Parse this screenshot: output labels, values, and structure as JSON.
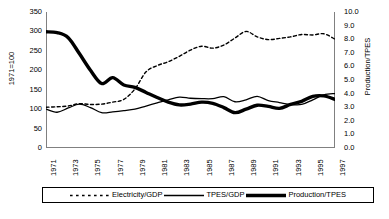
{
  "chart_data": {
    "type": "line",
    "title": "",
    "subtitle": "",
    "xlabel": "",
    "ylabel": "1971=100",
    "ylabel_right": "Production/TPES",
    "xlim": [
      1971,
      1997
    ],
    "ylim": [
      0,
      350
    ],
    "ylim_right": [
      0.0,
      10.0
    ],
    "grid": false,
    "legend_position": "bottom",
    "x": [
      1971,
      1972,
      1973,
      1974,
      1975,
      1976,
      1977,
      1978,
      1979,
      1980,
      1981,
      1982,
      1983,
      1984,
      1985,
      1986,
      1987,
      1988,
      1989,
      1990,
      1991,
      1992,
      1993,
      1994,
      1995,
      1996,
      1997
    ],
    "xticks": [
      "1971",
      "1973",
      "1975",
      "1977",
      "1979",
      "1981",
      "1983",
      "1985",
      "1987",
      "1989",
      "1991",
      "1993",
      "1995",
      "1997"
    ],
    "yticks_left": [
      "0",
      "50",
      "100",
      "150",
      "200",
      "250",
      "300",
      "350"
    ],
    "yticks_right": [
      "0.0",
      "1.0",
      "2.0",
      "3.0",
      "4.0",
      "5.0",
      "6.0",
      "7.0",
      "8.0",
      "9.0",
      "10.0"
    ],
    "series": [
      {
        "name": "Electricity/GDP",
        "style": "dashed",
        "axis": "left",
        "color": "#000000",
        "width": 1.4,
        "values": [
          105,
          106,
          108,
          114,
          112,
          113,
          118,
          125,
          152,
          196,
          212,
          222,
          236,
          252,
          262,
          257,
          265,
          283,
          300,
          286,
          279,
          282,
          286,
          292,
          291,
          294,
          280
        ]
      },
      {
        "name": "TPES/GDP",
        "style": "solid-thin",
        "axis": "left",
        "color": "#000000",
        "width": 1.3,
        "values": [
          100,
          92,
          103,
          113,
          104,
          91,
          93,
          96,
          100,
          108,
          116,
          124,
          131,
          128,
          127,
          127,
          132,
          119,
          124,
          133,
          122,
          117,
          112,
          112,
          124,
          137,
          140
        ]
      },
      {
        "name": "Production/TPES",
        "style": "solid-thick",
        "axis": "right",
        "color": "#000000",
        "width": 3.4,
        "values_left_scale": [
          299,
          297,
          284,
          243,
          200,
          166,
          181,
          162,
          156,
          143,
          130,
          118,
          111,
          113,
          118,
          115,
          104,
          91,
          100,
          110,
          107,
          102,
          112,
          120,
          133,
          134,
          125
        ],
        "values": [
          8.54,
          8.49,
          8.11,
          6.94,
          5.71,
          4.74,
          5.17,
          4.63,
          4.46,
          4.09,
          3.71,
          3.37,
          3.17,
          3.23,
          3.37,
          3.29,
          2.97,
          2.6,
          2.86,
          3.14,
          3.06,
          2.91,
          3.2,
          3.43,
          3.8,
          3.83,
          3.57
        ]
      }
    ]
  },
  "legend": {
    "entries": [
      {
        "label": "Electricity/GDP"
      },
      {
        "label": "TPES/GDP"
      },
      {
        "label": "Production/TPES"
      }
    ]
  }
}
